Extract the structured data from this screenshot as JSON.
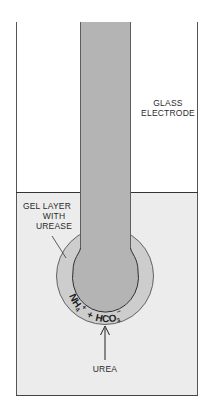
{
  "diagram": {
    "labels": {
      "glass_electrode_line1": "GLASS",
      "glass_electrode_line2": "ELECTRODE",
      "gel_line1": "GEL LAYER",
      "gel_line2": "WITH",
      "gel_line3": "UREASE",
      "products_nh4": "NH",
      "products_nh4_sub": "4",
      "products_nh4_sup": "+",
      "products_plus": "+",
      "products_hco3": "HCO",
      "products_hco3_sub": "3",
      "products_hco3_sup": "−",
      "substrate": "UREA"
    },
    "colors": {
      "background": "#ffffff",
      "solution": "#ececec",
      "electrode": "#b4b4b4",
      "gel_layer": "#cdcdcd",
      "outline": "#3a3a3a"
    }
  }
}
